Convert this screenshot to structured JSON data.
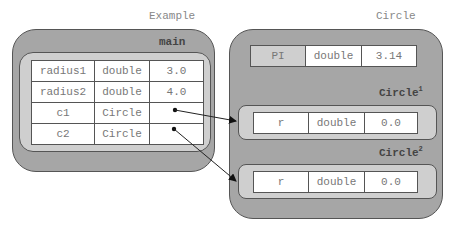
{
  "class_label": "Example",
  "main_frame": {
    "title": "main",
    "variables": [
      {
        "name": "radius1",
        "type": "double",
        "value": "3.0"
      },
      {
        "name": "radius2",
        "type": "double",
        "value": "4.0"
      },
      {
        "name": "c1",
        "type": "Circle",
        "value": "•"
      },
      {
        "name": "c2",
        "type": "Circle",
        "value": "•"
      }
    ]
  },
  "circle_class": {
    "label": "Circle",
    "static": {
      "name": "PI",
      "type": "double",
      "value": "3.14"
    },
    "instances": [
      {
        "title": "Circle",
        "sup": "1",
        "field": {
          "name": "r",
          "type": "double",
          "value": "0.0"
        }
      },
      {
        "title": "Circle",
        "sup": "2",
        "field": {
          "name": "r",
          "type": "double",
          "value": "0.0"
        }
      }
    ]
  }
}
